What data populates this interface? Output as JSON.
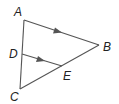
{
  "diagram": {
    "type": "geometry-triangle",
    "colors": {
      "line": "#555555",
      "label": "#222222",
      "background": "#ffffff"
    },
    "points": {
      "A": {
        "label": "A",
        "x": 24,
        "y": 20
      },
      "B": {
        "label": "B",
        "x": 99,
        "y": 45
      },
      "C": {
        "label": "C",
        "x": 20,
        "y": 89
      },
      "D": {
        "label": "D",
        "x": 22,
        "y": 54
      },
      "E": {
        "label": "E",
        "x": 62,
        "y": 66
      }
    },
    "segments": [
      "AB",
      "AC",
      "CB",
      "DE"
    ],
    "parallel_marks": [
      "AB",
      "DE"
    ]
  }
}
